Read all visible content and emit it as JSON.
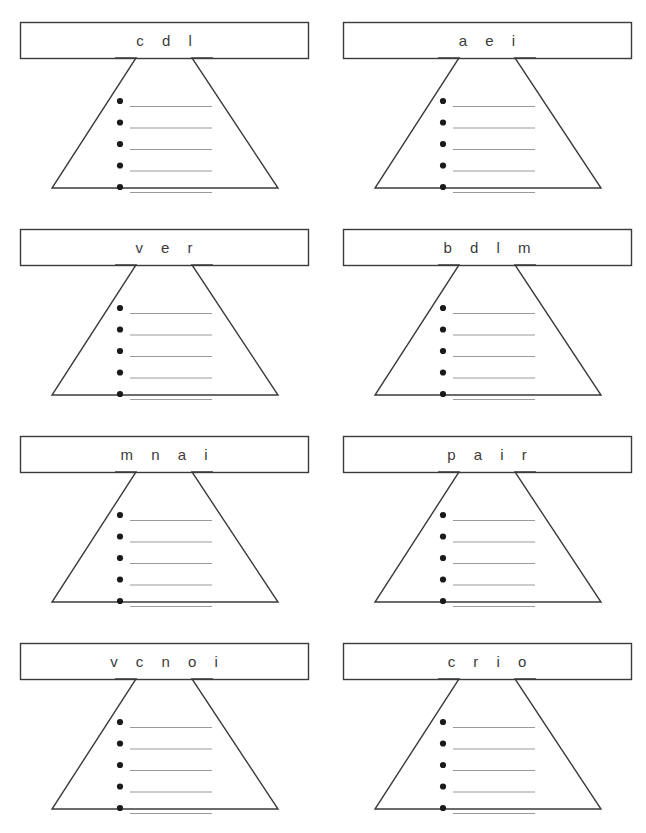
{
  "worksheet": {
    "title": "Word Funnel Worksheet",
    "grid": {
      "columns": 2,
      "rows": 4
    },
    "bullets_per_funnel": 5,
    "colors": {
      "outline": "#3b3b3b",
      "answer_line": "#9a9a9a",
      "bullet": "#1a1a1a",
      "page_background": "#ffffff",
      "label_text": "#3b3b3b"
    },
    "funnels": [
      {
        "id": "funnel-1",
        "position": {
          "row": 1,
          "column": 1
        },
        "label": "c d l",
        "letters": [
          "c",
          "d",
          "l"
        ],
        "answers": [
          "",
          "",
          "",
          "",
          ""
        ]
      },
      {
        "id": "funnel-2",
        "position": {
          "row": 1,
          "column": 2
        },
        "label": "a e i",
        "letters": [
          "a",
          "e",
          "i"
        ],
        "answers": [
          "",
          "",
          "",
          "",
          ""
        ]
      },
      {
        "id": "funnel-3",
        "position": {
          "row": 2,
          "column": 1
        },
        "label": "v e r",
        "letters": [
          "v",
          "e",
          "r"
        ],
        "answers": [
          "",
          "",
          "",
          "",
          ""
        ]
      },
      {
        "id": "funnel-4",
        "position": {
          "row": 2,
          "column": 2
        },
        "label": "b d l m",
        "letters": [
          "b",
          "d",
          "l",
          "m"
        ],
        "answers": [
          "",
          "",
          "",
          "",
          ""
        ]
      },
      {
        "id": "funnel-5",
        "position": {
          "row": 3,
          "column": 1
        },
        "label": "m n a i",
        "letters": [
          "m",
          "n",
          "a",
          "i"
        ],
        "answers": [
          "",
          "",
          "",
          "",
          ""
        ]
      },
      {
        "id": "funnel-6",
        "position": {
          "row": 3,
          "column": 2
        },
        "label": "p a i r",
        "letters": [
          "p",
          "a",
          "i",
          "r"
        ],
        "answers": [
          "",
          "",
          "",
          "",
          ""
        ]
      },
      {
        "id": "funnel-7",
        "position": {
          "row": 4,
          "column": 1
        },
        "label": "v c n o i",
        "letters": [
          "v",
          "c",
          "n",
          "o",
          "i"
        ],
        "answers": [
          "",
          "",
          "",
          "",
          ""
        ]
      },
      {
        "id": "funnel-8",
        "position": {
          "row": 4,
          "column": 2
        },
        "label": "c r i o",
        "letters": [
          "c",
          "r",
          "i",
          "o"
        ],
        "answers": [
          "",
          "",
          "",
          "",
          ""
        ]
      }
    ]
  }
}
